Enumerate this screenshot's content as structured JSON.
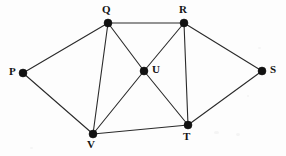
{
  "diagram": {
    "type": "graph",
    "background_color": "#fdfdfd",
    "edge_color": "#2a2a2a",
    "vertex_color": "#111111",
    "label_color": "#141414",
    "vertex_radius": 4,
    "vertices": [
      {
        "id": "P",
        "label": "P",
        "x": 23,
        "y": 73,
        "label_x": 9,
        "label_y": 66,
        "label_position": "left"
      },
      {
        "id": "Q",
        "label": "Q",
        "x": 108,
        "y": 23,
        "label_x": 102,
        "label_y": 4,
        "label_position": "above"
      },
      {
        "id": "R",
        "label": "R",
        "x": 184,
        "y": 23,
        "label_x": 179,
        "label_y": 4,
        "label_position": "above"
      },
      {
        "id": "S",
        "label": "S",
        "x": 262,
        "y": 71,
        "label_x": 270,
        "label_y": 64,
        "label_position": "right"
      },
      {
        "id": "U",
        "label": "U",
        "x": 144,
        "y": 71,
        "label_x": 152,
        "label_y": 64,
        "label_position": "right"
      },
      {
        "id": "T",
        "label": "T",
        "x": 188,
        "y": 125,
        "label_x": 183,
        "label_y": 131,
        "label_position": "below"
      },
      {
        "id": "V",
        "label": "V",
        "x": 93,
        "y": 134,
        "label_x": 87,
        "label_y": 139,
        "label_position": "below"
      }
    ],
    "edges": [
      {
        "from": "P",
        "to": "Q"
      },
      {
        "from": "P",
        "to": "V"
      },
      {
        "from": "Q",
        "to": "R"
      },
      {
        "from": "Q",
        "to": "V"
      },
      {
        "from": "Q",
        "to": "U"
      },
      {
        "from": "U",
        "to": "T"
      },
      {
        "from": "R",
        "to": "U"
      },
      {
        "from": "U",
        "to": "V"
      },
      {
        "from": "R",
        "to": "T"
      },
      {
        "from": "R",
        "to": "S"
      },
      {
        "from": "S",
        "to": "T"
      },
      {
        "from": "V",
        "to": "T"
      }
    ],
    "specks": [
      {
        "x": 258,
        "y": 47,
        "w": 3,
        "h": 2
      },
      {
        "x": 247,
        "y": 95,
        "w": 2,
        "h": 2
      },
      {
        "x": 214,
        "y": 131,
        "w": 5,
        "h": 3
      },
      {
        "x": 236,
        "y": 133,
        "w": 4,
        "h": 3
      },
      {
        "x": 30,
        "y": 147,
        "w": 3,
        "h": 2
      }
    ]
  }
}
